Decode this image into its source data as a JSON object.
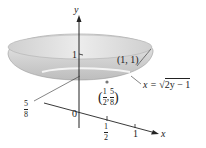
{
  "figure": {
    "axes": {
      "y_label": "y",
      "x_label": "x",
      "origin_label": "0",
      "y_tick_1": "1",
      "x_tick_half": {
        "num": "1",
        "den": "2"
      },
      "x_tick_1": "1"
    },
    "annotations": {
      "point_1_1": "(1, 1)",
      "curve_eq_lhs": "x = ",
      "curve_eq_rhs": "2y − 1",
      "point_half_58": {
        "x_num": "1",
        "x_den": "2",
        "y_num": "5",
        "y_den": "8"
      },
      "level_58": {
        "num": "5",
        "den": "8"
      }
    },
    "colors": {
      "bowl_fill": "#d9d9d9",
      "bowl_rim": "#e9e9e9",
      "axis": "#222222"
    }
  }
}
